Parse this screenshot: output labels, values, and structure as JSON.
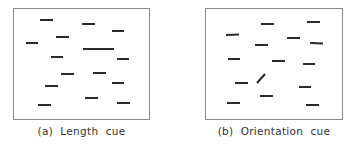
{
  "panels": [
    {
      "id": "a",
      "caption": "(a)  Length  cue",
      "box": {
        "x": 13,
        "y": 8,
        "w": 137,
        "h": 112
      },
      "segments": [
        {
          "x1": 40,
          "y1": 20,
          "x2": 53,
          "y2": 20
        },
        {
          "x1": 82,
          "y1": 24,
          "x2": 95,
          "y2": 24
        },
        {
          "x1": 112,
          "y1": 31,
          "x2": 124,
          "y2": 31
        },
        {
          "x1": 56,
          "y1": 37,
          "x2": 69,
          "y2": 37
        },
        {
          "x1": 26,
          "y1": 43,
          "x2": 38,
          "y2": 43
        },
        {
          "x1": 83,
          "y1": 49,
          "x2": 114,
          "y2": 49,
          "target": true
        },
        {
          "x1": 51,
          "y1": 57,
          "x2": 63,
          "y2": 57
        },
        {
          "x1": 117,
          "y1": 59,
          "x2": 129,
          "y2": 59
        },
        {
          "x1": 61,
          "y1": 74,
          "x2": 74,
          "y2": 74
        },
        {
          "x1": 93,
          "y1": 73,
          "x2": 106,
          "y2": 73
        },
        {
          "x1": 112,
          "y1": 83,
          "x2": 124,
          "y2": 83
        },
        {
          "x1": 45,
          "y1": 86,
          "x2": 58,
          "y2": 86
        },
        {
          "x1": 85,
          "y1": 98,
          "x2": 98,
          "y2": 98
        },
        {
          "x1": 38,
          "y1": 105,
          "x2": 51,
          "y2": 105
        },
        {
          "x1": 117,
          "y1": 103,
          "x2": 130,
          "y2": 103
        }
      ]
    },
    {
      "id": "b",
      "caption": "(b)  Orientation  cue",
      "box": {
        "x": 205,
        "y": 8,
        "w": 138,
        "h": 112
      },
      "segments": [
        {
          "x1": 261,
          "y1": 24,
          "x2": 274,
          "y2": 24
        },
        {
          "x1": 307,
          "y1": 22,
          "x2": 320,
          "y2": 22
        },
        {
          "x1": 226,
          "y1": 35,
          "x2": 239,
          "y2": 34.5
        },
        {
          "x1": 287,
          "y1": 38,
          "x2": 300,
          "y2": 38
        },
        {
          "x1": 255,
          "y1": 45,
          "x2": 268,
          "y2": 45
        },
        {
          "x1": 310,
          "y1": 43,
          "x2": 323,
          "y2": 43.5
        },
        {
          "x1": 228,
          "y1": 59,
          "x2": 240,
          "y2": 59
        },
        {
          "x1": 272,
          "y1": 61,
          "x2": 285,
          "y2": 61
        },
        {
          "x1": 303,
          "y1": 64,
          "x2": 315,
          "y2": 64
        },
        {
          "x1": 235,
          "y1": 83,
          "x2": 248,
          "y2": 83
        },
        {
          "x1": 257,
          "y1": 83,
          "x2": 265,
          "y2": 74,
          "target": true
        },
        {
          "x1": 299,
          "y1": 87,
          "x2": 311,
          "y2": 87
        },
        {
          "x1": 260,
          "y1": 96,
          "x2": 273,
          "y2": 96
        },
        {
          "x1": 227,
          "y1": 103,
          "x2": 240,
          "y2": 103
        },
        {
          "x1": 306,
          "y1": 105,
          "x2": 319,
          "y2": 105
        }
      ]
    }
  ],
  "style": {
    "segment_color": "#2a2a2a",
    "segment_width": 2,
    "border_color": "#8a8a8a"
  }
}
